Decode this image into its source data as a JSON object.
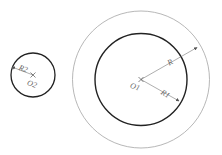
{
  "diagram": {
    "title": "",
    "small_circle": {
      "center_label": "O2",
      "radius_label": "R2"
    },
    "large_circle": {
      "center_label": "O1",
      "outer_radius_label": "R",
      "inner_radius_label": "R1"
    },
    "colors": {
      "thin": "#9a9a9a",
      "thick": "#222222",
      "text": "#666666"
    }
  }
}
